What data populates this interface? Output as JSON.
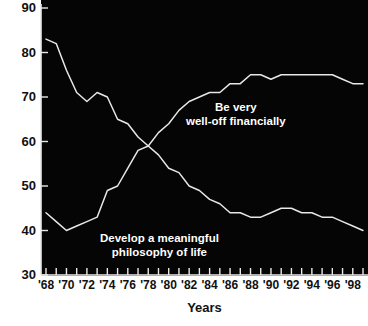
{
  "chart_data": {
    "type": "line",
    "title": "",
    "xlabel": "Years",
    "ylabel": "Percentage",
    "ylim": [
      30,
      90
    ],
    "yticks": [
      30,
      40,
      50,
      60,
      70,
      80,
      90
    ],
    "xlim": [
      1968,
      1999
    ],
    "xticks": [
      1968,
      1970,
      1972,
      1974,
      1976,
      1978,
      1980,
      1982,
      1984,
      1986,
      1988,
      1990,
      1992,
      1994,
      1996,
      1998
    ],
    "xtick_labels": [
      "'68",
      "'70",
      "'72",
      "'74",
      "'76",
      "'78",
      "'80",
      "'82",
      "'84",
      "'86",
      "'88",
      "'90",
      "'92",
      "'94",
      "'96",
      "'98"
    ],
    "grid": false,
    "legend": "inline-annotations",
    "background": "#050505",
    "line_color": "#e8e8e8",
    "x": [
      1968,
      1969,
      1970,
      1971,
      1972,
      1973,
      1974,
      1975,
      1976,
      1977,
      1978,
      1979,
      1980,
      1981,
      1982,
      1983,
      1984,
      1985,
      1986,
      1987,
      1988,
      1989,
      1990,
      1991,
      1992,
      1993,
      1994,
      1995,
      1996,
      1997,
      1998,
      1999
    ],
    "series": [
      {
        "name": "Develop a meaningful philosophy of life",
        "label_line1": "Develop a meaningful",
        "label_line2": "philosophy of life",
        "values": [
          83,
          82,
          76,
          71,
          69,
          71,
          70,
          65,
          64,
          61,
          59,
          57,
          54,
          53,
          50,
          49,
          47,
          46,
          44,
          44,
          43,
          43,
          44,
          45,
          45,
          44,
          44,
          43,
          43,
          42,
          41,
          40
        ]
      },
      {
        "name": "Be very well-off financially",
        "label_line1": "Be very",
        "label_line2": "well-off financially",
        "values": [
          44,
          42,
          40,
          41,
          42,
          43,
          49,
          50,
          54,
          58,
          59,
          62,
          64,
          67,
          69,
          70,
          71,
          71,
          73,
          73,
          75,
          75,
          74,
          75,
          75,
          75,
          75,
          75,
          75,
          74,
          73,
          73
        ]
      }
    ]
  },
  "annotations": {
    "welloff": "Be very\nwell-off financially",
    "philosophy": "Develop a meaningful\nphilosophy of life"
  }
}
